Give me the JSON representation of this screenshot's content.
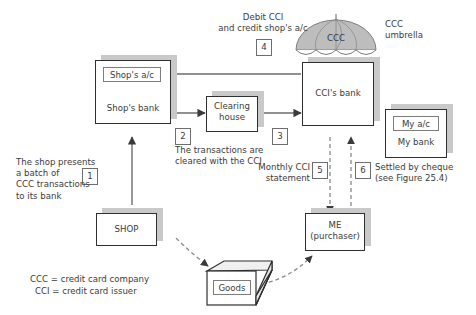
{
  "figure": {
    "legend": [
      "CCC = credit card company",
      "CCI = credit card issuer"
    ]
  },
  "nodes": {
    "shops_bank": {
      "label": "Shop's bank",
      "sub_label": "Shop's a/c"
    },
    "clearing_house": {
      "label": "Clearing\nhouse"
    },
    "ccis_bank": {
      "label": "CCI's bank"
    },
    "my_bank": {
      "label": "My bank",
      "sub_label": "My a/c"
    },
    "shop": {
      "label": "SHOP"
    },
    "me": {
      "label": "ME\n(purchaser)"
    },
    "goods": {
      "label": "Goods"
    },
    "umbrella": {
      "label": "CCC",
      "caption": "CCC\numbrella"
    }
  },
  "steps": [
    {
      "number": "1",
      "caption": "The shop presents\na batch of\nCCC transactions\nto its bank"
    },
    {
      "number": "2",
      "caption": ""
    },
    {
      "number": "3",
      "caption": "The transactions are\ncleared with the CCI"
    },
    {
      "number": "4",
      "caption": "Debit CCI\nand credit shop's a/c"
    },
    {
      "number": "5",
      "caption": "Monthly CCI\nstatement"
    },
    {
      "number": "6",
      "caption": "Settled by cheque\n(see Figure 25.4)"
    }
  ],
  "colors": {
    "stroke": "#2f2f2f",
    "shadow": "#c9c9c9",
    "text": "#3b3b3b",
    "umbrella_fill": "#b8b8b8",
    "line": "#6b6b6b"
  }
}
